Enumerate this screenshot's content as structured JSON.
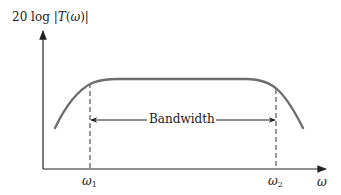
{
  "diagram": {
    "y_axis_label": {
      "prefix": "20 log |",
      "func": "T",
      "paren_open": "(",
      "var": "ω",
      "paren_close": ")|"
    },
    "x_axis_label": "ω",
    "markers": [
      {
        "symbol": "ω",
        "subscript": "1"
      },
      {
        "symbol": "ω",
        "subscript": "2"
      }
    ],
    "bandwidth_label": "Bandwidth",
    "colors": {
      "curve": "#6e6e6e",
      "axes": "#222222",
      "dashed": "#444444",
      "text": "#222222"
    }
  }
}
